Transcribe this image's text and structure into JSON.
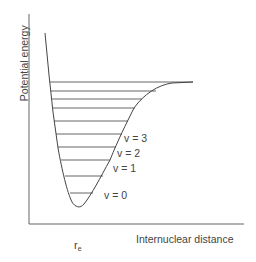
{
  "diagram": {
    "y_axis_label": "Potential energy",
    "x_axis_label": "Internuclear distance",
    "equilibrium_label": {
      "main": "r",
      "sub": "e"
    },
    "level_labels": [
      {
        "text": "v = 0",
        "x": 104,
        "y": 195
      },
      {
        "text": "v = 1",
        "x": 113,
        "y": 168
      },
      {
        "text": "v = 2",
        "x": 117,
        "y": 153
      },
      {
        "text": "v = 3",
        "x": 124,
        "y": 138
      }
    ],
    "vibrational_levels_y": [
      82,
      91,
      99,
      108,
      121,
      134,
      147,
      160,
      176,
      193
    ],
    "colors": {
      "axis": "#555555",
      "curve": "#444444",
      "level": "#555555",
      "text": "#444444"
    }
  }
}
